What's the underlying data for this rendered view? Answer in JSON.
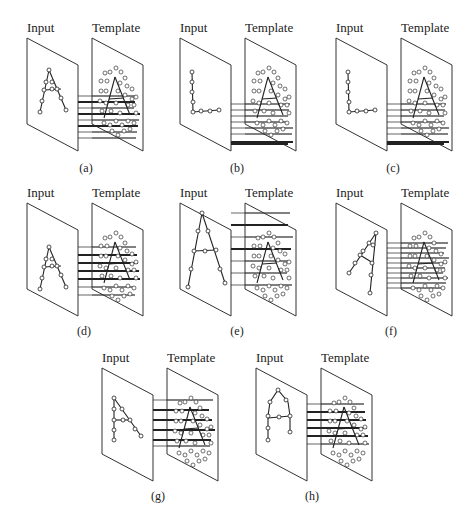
{
  "figure": {
    "colors": {
      "ink": "#222222",
      "plane_stroke": "#333333",
      "background": "#ffffff"
    },
    "plane_title_input": "Input",
    "plane_title_template": "Template",
    "panels": [
      {
        "id": "a",
        "caption": "(a)",
        "origin": [
          27,
          38
        ],
        "caption_pos": [
          86,
          172
        ],
        "input_shape": "A",
        "input_strokes": [
          [
            [
              22,
              32
            ],
            [
              13,
              74
            ]
          ],
          [
            [
              22,
              32
            ],
            [
              39,
              72
            ]
          ],
          [
            [
              17,
              52
            ],
            [
              34,
              51
            ]
          ]
        ],
        "input_nodes": [
          [
            22,
            32
          ],
          [
            19,
            44
          ],
          [
            17,
            52
          ],
          [
            15,
            63
          ],
          [
            13,
            74
          ],
          [
            25,
            44
          ],
          [
            30,
            51
          ],
          [
            34,
            60
          ],
          [
            39,
            72
          ],
          [
            25,
            51
          ]
        ],
        "links": [
          [
            52,
            58,
            0
          ],
          [
            52,
            64,
            1
          ],
          [
            52,
            70,
            0
          ],
          [
            52,
            76,
            1
          ],
          [
            52,
            82,
            0
          ],
          [
            52,
            88,
            1
          ],
          [
            52,
            94,
            0
          ],
          [
            52,
            100,
            0
          ]
        ]
      },
      {
        "id": "b",
        "caption": "(b)",
        "origin": [
          180,
          38
        ],
        "caption_pos": [
          237,
          172
        ],
        "input_shape": "L",
        "input_strokes": [
          [
            [
              12,
              34
            ],
            [
              13,
              74
            ],
            [
              39,
              72
            ]
          ]
        ],
        "input_nodes": [
          [
            12,
            34
          ],
          [
            12,
            44
          ],
          [
            12,
            54
          ],
          [
            13,
            64
          ],
          [
            13,
            74
          ],
          [
            21,
            73
          ],
          [
            30,
            73
          ],
          [
            39,
            72
          ]
        ],
        "links": [
          [
            52,
            66,
            0
          ],
          [
            52,
            72,
            0
          ],
          [
            52,
            78,
            0
          ],
          [
            52,
            84,
            0
          ],
          [
            52,
            90,
            0
          ],
          [
            52,
            96,
            0
          ],
          [
            52,
            104,
            1
          ],
          [
            52,
            105,
            1
          ],
          [
            52,
            106,
            1
          ]
        ]
      },
      {
        "id": "c",
        "caption": "(c)",
        "origin": [
          336,
          38
        ],
        "caption_pos": [
          393,
          172
        ],
        "input_shape": "L",
        "input_strokes": [
          [
            [
              12,
              34
            ],
            [
              13,
              74
            ],
            [
              39,
              72
            ]
          ]
        ],
        "input_nodes": [
          [
            12,
            34
          ],
          [
            12,
            44
          ],
          [
            12,
            54
          ],
          [
            13,
            64
          ],
          [
            13,
            74
          ],
          [
            21,
            73
          ],
          [
            30,
            73
          ],
          [
            39,
            72
          ]
        ],
        "links": [
          [
            52,
            66,
            0
          ],
          [
            52,
            72,
            0
          ],
          [
            52,
            78,
            0
          ],
          [
            52,
            84,
            0
          ],
          [
            52,
            90,
            0
          ],
          [
            52,
            96,
            0
          ],
          [
            52,
            104,
            1
          ],
          [
            52,
            105,
            1
          ],
          [
            52,
            106,
            1
          ]
        ]
      },
      {
        "id": "d",
        "caption": "(d)",
        "origin": [
          27,
          203
        ],
        "caption_pos": [
          84,
          335
        ],
        "input_shape": "A",
        "input_strokes": [
          [
            [
              22,
              44
            ],
            [
              13,
              86
            ]
          ],
          [
            [
              22,
              44
            ],
            [
              39,
              84
            ]
          ],
          [
            [
              17,
              64
            ],
            [
              34,
              63
            ]
          ]
        ],
        "input_nodes": [
          [
            22,
            44
          ],
          [
            19,
            56
          ],
          [
            17,
            64
          ],
          [
            15,
            75
          ],
          [
            13,
            86
          ],
          [
            25,
            56
          ],
          [
            30,
            63
          ],
          [
            34,
            72
          ],
          [
            39,
            84
          ],
          [
            25,
            63
          ]
        ],
        "links": [
          [
            52,
            44,
            0
          ],
          [
            52,
            52,
            1
          ],
          [
            52,
            60,
            1
          ],
          [
            52,
            68,
            1
          ],
          [
            52,
            76,
            1
          ],
          [
            52,
            84,
            0
          ],
          [
            52,
            92,
            0
          ]
        ]
      },
      {
        "id": "e",
        "caption": "(e)",
        "origin": [
          180,
          203
        ],
        "caption_pos": [
          237,
          335
        ],
        "input_shape": "A-wide",
        "input_strokes": [
          [
            [
              22,
              10
            ],
            [
              8,
              84
            ]
          ],
          [
            [
              22,
              10
            ],
            [
              45,
              80
            ]
          ],
          [
            [
              14,
              48
            ],
            [
              36,
              47
            ]
          ]
        ],
        "input_nodes": [
          [
            22,
            10
          ],
          [
            18,
            28
          ],
          [
            14,
            48
          ],
          [
            11,
            66
          ],
          [
            8,
            84
          ],
          [
            28,
            28
          ],
          [
            25,
            48
          ],
          [
            36,
            47
          ],
          [
            40,
            66
          ],
          [
            45,
            80
          ]
        ],
        "links": [
          [
            52,
            10,
            0
          ],
          [
            52,
            22,
            1
          ],
          [
            52,
            34,
            0
          ],
          [
            52,
            46,
            1
          ],
          [
            52,
            58,
            0
          ],
          [
            52,
            70,
            0
          ],
          [
            52,
            82,
            0
          ]
        ]
      },
      {
        "id": "f",
        "caption": "(f)",
        "origin": [
          336,
          203
        ],
        "caption_pos": [
          391,
          335
        ],
        "input_shape": "A-rotated",
        "input_strokes": [
          [
            [
              40,
              30
            ],
            [
              13,
              70
            ]
          ],
          [
            [
              40,
              30
            ],
            [
              34,
              90
            ]
          ],
          [
            [
              24,
              52
            ],
            [
              37,
              60
            ]
          ]
        ],
        "input_nodes": [
          [
            40,
            30
          ],
          [
            33,
            40
          ],
          [
            27,
            48
          ],
          [
            24,
            52
          ],
          [
            19,
            60
          ],
          [
            13,
            70
          ],
          [
            37,
            42
          ],
          [
            36,
            60
          ],
          [
            35,
            72
          ],
          [
            34,
            90
          ]
        ],
        "links": [
          [
            52,
            40,
            0
          ],
          [
            52,
            45,
            0
          ],
          [
            52,
            50,
            0
          ],
          [
            52,
            55,
            0
          ],
          [
            52,
            60,
            0
          ],
          [
            52,
            65,
            0
          ],
          [
            52,
            70,
            0
          ],
          [
            52,
            75,
            0
          ],
          [
            52,
            80,
            0
          ],
          [
            52,
            85,
            0
          ]
        ]
      },
      {
        "id": "g",
        "caption": "(g)",
        "origin": [
          102,
          368
        ],
        "caption_pos": [
          158,
          500
        ],
        "input_shape": "A-half",
        "input_strokes": [
          [
            [
              12,
              30
            ],
            [
              12,
              72
            ]
          ],
          [
            [
              12,
              30
            ],
            [
              39,
              68
            ]
          ],
          [
            [
              12,
              52
            ],
            [
              28,
              52
            ]
          ]
        ],
        "input_nodes": [
          [
            12,
            30
          ],
          [
            12,
            41
          ],
          [
            12,
            52
          ],
          [
            12,
            62
          ],
          [
            12,
            72
          ],
          [
            20,
            41
          ],
          [
            21,
            52
          ],
          [
            28,
            52
          ],
          [
            33,
            61
          ],
          [
            39,
            68
          ]
        ],
        "links": [
          [
            52,
            32,
            0
          ],
          [
            52,
            42,
            1
          ],
          [
            52,
            52,
            1
          ],
          [
            52,
            62,
            1
          ],
          [
            52,
            72,
            1
          ],
          [
            52,
            78,
            0
          ]
        ]
      },
      {
        "id": "h",
        "caption": "(h)",
        "origin": [
          256,
          368
        ],
        "caption_pos": [
          312,
          500
        ],
        "input_shape": "A-round",
        "input_strokes": [
          [
            [
              12,
              72
            ],
            [
              12,
              48
            ],
            [
              14,
              34
            ],
            [
              22,
              22
            ],
            [
              32,
              34
            ],
            [
              34,
              48
            ],
            [
              34,
              64
            ]
          ],
          [
            [
              12,
              50
            ],
            [
              34,
              48
            ]
          ]
        ],
        "input_nodes": [
          [
            22,
            22
          ],
          [
            14,
            34
          ],
          [
            30,
            32
          ],
          [
            12,
            48
          ],
          [
            23,
            49
          ],
          [
            34,
            48
          ],
          [
            12,
            60
          ],
          [
            12,
            72
          ],
          [
            34,
            64
          ]
        ],
        "links": [
          [
            52,
            36,
            0
          ],
          [
            52,
            44,
            1
          ],
          [
            52,
            52,
            1
          ],
          [
            52,
            60,
            1
          ],
          [
            52,
            68,
            1
          ],
          [
            52,
            76,
            0
          ]
        ]
      }
    ],
    "template": {
      "a_strokes": [
        [
          [
            23,
            34
          ],
          [
            12,
            75
          ]
        ],
        [
          [
            23,
            34
          ],
          [
            38,
            72
          ]
        ],
        [
          [
            17,
            56
          ],
          [
            32,
            55
          ]
        ]
      ],
      "dots": [
        [
          13,
          30
        ],
        [
          18,
          29
        ],
        [
          24,
          25
        ],
        [
          29,
          29
        ],
        [
          33,
          35
        ],
        [
          9,
          38
        ],
        [
          15,
          38
        ],
        [
          28,
          40
        ],
        [
          35,
          43
        ],
        [
          40,
          46
        ],
        [
          9,
          48
        ],
        [
          14,
          48
        ],
        [
          26,
          48
        ],
        [
          33,
          52
        ],
        [
          40,
          56
        ],
        [
          44,
          54
        ],
        [
          8,
          58
        ],
        [
          14,
          60
        ],
        [
          24,
          60
        ],
        [
          36,
          62
        ],
        [
          42,
          62
        ],
        [
          10,
          68
        ],
        [
          19,
          68
        ],
        [
          28,
          70
        ],
        [
          44,
          70
        ],
        [
          12,
          80
        ],
        [
          18,
          82
        ],
        [
          24,
          78
        ],
        [
          30,
          82
        ],
        [
          36,
          78
        ],
        [
          20,
          88
        ],
        [
          26,
          92
        ],
        [
          32,
          88
        ],
        [
          38,
          86
        ],
        [
          42,
          80
        ]
      ]
    }
  }
}
